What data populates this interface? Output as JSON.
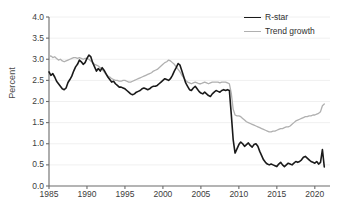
{
  "chart_data": {
    "type": "line",
    "title": "",
    "subtitle": "",
    "xlabel": "",
    "ylabel": "Percent",
    "xlim": [
      1985,
      2022
    ],
    "ylim": [
      0.0,
      4.0
    ],
    "grid": "horizontal",
    "legend_position": "top-right",
    "y_ticks": [
      "0.0",
      "0.5",
      "1.0",
      "1.5",
      "2.0",
      "2.5",
      "3.0",
      "3.5",
      "4.0"
    ],
    "y_tick_values": [
      0.0,
      0.5,
      1.0,
      1.5,
      2.0,
      2.5,
      3.0,
      3.5,
      4.0
    ],
    "x_ticks": [
      "1985",
      "1990",
      "1995",
      "2000",
      "2005",
      "2010",
      "2015",
      "2020"
    ],
    "x_tick_values": [
      1985,
      1990,
      1995,
      2000,
      2005,
      2010,
      2015,
      2020
    ],
    "series": [
      {
        "name": "R-star",
        "color": "#1a1a1a",
        "width": 1.6,
        "x": [
          1985.0,
          1985.25,
          1985.5,
          1985.75,
          1986.0,
          1986.25,
          1986.5,
          1986.75,
          1987.0,
          1987.25,
          1987.5,
          1987.75,
          1988.0,
          1988.25,
          1988.5,
          1988.75,
          1989.0,
          1989.25,
          1989.5,
          1989.75,
          1990.0,
          1990.25,
          1990.5,
          1990.75,
          1991.0,
          1991.25,
          1991.5,
          1991.75,
          1992.0,
          1992.25,
          1992.5,
          1992.75,
          1993.0,
          1993.25,
          1993.5,
          1993.75,
          1994.0,
          1994.25,
          1994.5,
          1994.75,
          1995.0,
          1995.25,
          1995.5,
          1995.75,
          1996.0,
          1996.25,
          1996.5,
          1996.75,
          1997.0,
          1997.25,
          1997.5,
          1997.75,
          1998.0,
          1998.25,
          1998.5,
          1998.75,
          1999.0,
          1999.25,
          1999.5,
          1999.75,
          2000.0,
          2000.25,
          2000.5,
          2000.75,
          2001.0,
          2001.25,
          2001.5,
          2001.75,
          2002.0,
          2002.25,
          2002.5,
          2002.75,
          2003.0,
          2003.25,
          2003.5,
          2003.75,
          2004.0,
          2004.25,
          2004.5,
          2004.75,
          2005.0,
          2005.25,
          2005.5,
          2005.75,
          2006.0,
          2006.25,
          2006.5,
          2006.75,
          2007.0,
          2007.25,
          2007.5,
          2007.75,
          2008.0,
          2008.25,
          2008.5,
          2008.75,
          2009.0,
          2009.25,
          2009.5,
          2009.75,
          2010.0,
          2010.25,
          2010.5,
          2010.75,
          2011.0,
          2011.25,
          2011.5,
          2011.75,
          2012.0,
          2012.25,
          2012.5,
          2012.75,
          2013.0,
          2013.25,
          2013.5,
          2013.75,
          2014.0,
          2014.25,
          2014.5,
          2014.75,
          2015.0,
          2015.25,
          2015.5,
          2015.75,
          2016.0,
          2016.25,
          2016.5,
          2016.75,
          2017.0,
          2017.25,
          2017.5,
          2017.75,
          2018.0,
          2018.25,
          2018.5,
          2018.75,
          2019.0,
          2019.25,
          2019.5,
          2019.75,
          2020.0,
          2020.25,
          2020.5,
          2020.75,
          2021.0,
          2021.25
        ],
        "values": [
          2.7,
          2.62,
          2.66,
          2.58,
          2.48,
          2.42,
          2.36,
          2.3,
          2.28,
          2.32,
          2.45,
          2.52,
          2.6,
          2.72,
          2.82,
          2.88,
          2.98,
          2.94,
          2.88,
          2.92,
          3.02,
          3.1,
          3.06,
          2.92,
          2.82,
          2.72,
          2.78,
          2.72,
          2.8,
          2.74,
          2.66,
          2.58,
          2.52,
          2.46,
          2.48,
          2.42,
          2.38,
          2.34,
          2.34,
          2.32,
          2.3,
          2.26,
          2.22,
          2.18,
          2.16,
          2.18,
          2.22,
          2.24,
          2.26,
          2.3,
          2.32,
          2.3,
          2.28,
          2.3,
          2.34,
          2.36,
          2.36,
          2.38,
          2.42,
          2.46,
          2.5,
          2.54,
          2.52,
          2.5,
          2.54,
          2.62,
          2.72,
          2.8,
          2.9,
          2.86,
          2.72,
          2.58,
          2.44,
          2.36,
          2.28,
          2.26,
          2.32,
          2.36,
          2.3,
          2.24,
          2.2,
          2.18,
          2.22,
          2.18,
          2.14,
          2.12,
          2.18,
          2.22,
          2.26,
          2.24,
          2.22,
          2.26,
          2.28,
          2.26,
          2.28,
          2.26,
          1.7,
          1.1,
          0.78,
          0.88,
          0.98,
          1.04,
          1.0,
          0.94,
          0.98,
          1.02,
          0.96,
          0.92,
          0.98,
          1.0,
          0.94,
          0.82,
          0.72,
          0.62,
          0.56,
          0.52,
          0.5,
          0.52,
          0.5,
          0.48,
          0.46,
          0.52,
          0.56,
          0.5,
          0.46,
          0.5,
          0.54,
          0.52,
          0.5,
          0.54,
          0.58,
          0.56,
          0.58,
          0.62,
          0.68,
          0.7,
          0.66,
          0.62,
          0.58,
          0.56,
          0.54,
          0.58,
          0.52,
          0.56,
          0.86,
          0.45
        ]
      },
      {
        "name": "Trend growth",
        "color": "#b0b0b0",
        "width": 1.3,
        "x": [
          1985.0,
          1985.25,
          1985.5,
          1985.75,
          1986.0,
          1986.25,
          1986.5,
          1986.75,
          1987.0,
          1987.25,
          1987.5,
          1987.75,
          1988.0,
          1988.25,
          1988.5,
          1988.75,
          1989.0,
          1989.25,
          1989.5,
          1989.75,
          1990.0,
          1990.25,
          1990.5,
          1990.75,
          1991.0,
          1991.25,
          1991.5,
          1991.75,
          1992.0,
          1992.25,
          1992.5,
          1992.75,
          1993.0,
          1993.25,
          1993.5,
          1993.75,
          1994.0,
          1994.25,
          1994.5,
          1994.75,
          1995.0,
          1995.25,
          1995.5,
          1995.75,
          1996.0,
          1996.25,
          1996.5,
          1996.75,
          1997.0,
          1997.25,
          1997.5,
          1997.75,
          1998.0,
          1998.25,
          1998.5,
          1998.75,
          1999.0,
          1999.25,
          1999.5,
          1999.75,
          2000.0,
          2000.25,
          2000.5,
          2000.75,
          2001.0,
          2001.25,
          2001.5,
          2001.75,
          2002.0,
          2002.25,
          2002.5,
          2002.75,
          2003.0,
          2003.25,
          2003.5,
          2003.75,
          2004.0,
          2004.25,
          2004.5,
          2004.75,
          2005.0,
          2005.25,
          2005.5,
          2005.75,
          2006.0,
          2006.25,
          2006.5,
          2006.75,
          2007.0,
          2007.25,
          2007.5,
          2007.75,
          2008.0,
          2008.25,
          2008.5,
          2008.75,
          2009.0,
          2009.25,
          2009.5,
          2009.75,
          2010.0,
          2010.25,
          2010.5,
          2010.75,
          2011.0,
          2011.25,
          2011.5,
          2011.75,
          2012.0,
          2012.25,
          2012.5,
          2012.75,
          2013.0,
          2013.25,
          2013.5,
          2013.75,
          2014.0,
          2014.25,
          2014.5,
          2014.75,
          2015.0,
          2015.25,
          2015.5,
          2015.75,
          2016.0,
          2016.25,
          2016.5,
          2016.75,
          2017.0,
          2017.25,
          2017.5,
          2017.75,
          2018.0,
          2018.25,
          2018.5,
          2018.75,
          2019.0,
          2019.25,
          2019.5,
          2019.75,
          2020.0,
          2020.25,
          2020.5,
          2020.75,
          2021.0,
          2021.25
        ],
        "values": [
          3.06,
          3.08,
          3.04,
          3.06,
          3.02,
          2.98,
          3.0,
          2.96,
          2.94,
          2.96,
          2.98,
          3.0,
          3.02,
          3.04,
          3.04,
          3.02,
          3.04,
          3.02,
          3.0,
          3.02,
          3.02,
          3.0,
          2.96,
          2.92,
          2.88,
          2.86,
          2.84,
          2.8,
          2.76,
          2.7,
          2.64,
          2.6,
          2.58,
          2.54,
          2.52,
          2.5,
          2.5,
          2.48,
          2.48,
          2.5,
          2.5,
          2.48,
          2.46,
          2.46,
          2.48,
          2.5,
          2.52,
          2.54,
          2.56,
          2.58,
          2.6,
          2.62,
          2.64,
          2.66,
          2.68,
          2.72,
          2.74,
          2.76,
          2.8,
          2.84,
          2.88,
          2.92,
          2.94,
          2.98,
          2.96,
          2.92,
          2.88,
          2.82,
          2.76,
          2.7,
          2.62,
          2.56,
          2.5,
          2.46,
          2.44,
          2.42,
          2.44,
          2.46,
          2.44,
          2.42,
          2.42,
          2.44,
          2.46,
          2.44,
          2.42,
          2.44,
          2.46,
          2.46,
          2.46,
          2.46,
          2.44,
          2.46,
          2.46,
          2.46,
          2.44,
          2.42,
          2.2,
          1.82,
          1.68,
          1.66,
          1.66,
          1.64,
          1.6,
          1.56,
          1.52,
          1.5,
          1.48,
          1.46,
          1.44,
          1.42,
          1.4,
          1.38,
          1.36,
          1.34,
          1.32,
          1.3,
          1.28,
          1.28,
          1.3,
          1.3,
          1.32,
          1.34,
          1.36,
          1.36,
          1.38,
          1.4,
          1.4,
          1.42,
          1.46,
          1.5,
          1.54,
          1.56,
          1.58,
          1.6,
          1.62,
          1.64,
          1.64,
          1.66,
          1.66,
          1.68,
          1.68,
          1.7,
          1.72,
          1.76,
          1.9,
          1.94
        ]
      }
    ]
  },
  "legend": {
    "items": [
      {
        "label": "R-star",
        "color": "#1a1a1a"
      },
      {
        "label": "Trend growth",
        "color": "#b0b0b0"
      }
    ]
  },
  "axes": {
    "y_title": "Percent"
  }
}
